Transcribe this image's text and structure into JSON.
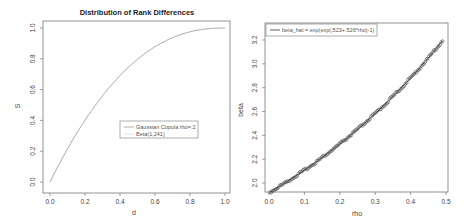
{
  "chart_data": [
    {
      "type": "line",
      "title": "Distribution of Rank Differences",
      "xlabel": "d",
      "ylabel": "S",
      "xlim": [
        0,
        1
      ],
      "ylim": [
        0,
        1
      ],
      "xticks": [
        "0.0",
        "0.2",
        "0.4",
        "0.6",
        "0.8",
        "1.0"
      ],
      "yticks": [
        "0.0",
        "0.2",
        "0.4",
        "0.6",
        "0.8",
        "1.0"
      ],
      "grid": false,
      "legend": {
        "position": "center-right",
        "entries": [
          "Gaussian Copula rho=.2",
          "Beta(1,241)"
        ]
      },
      "series": [
        {
          "name": "Gaussian Copula rho=.2",
          "x": [
            0.0,
            0.1,
            0.2,
            0.3,
            0.4,
            0.5,
            0.6,
            0.7,
            0.8,
            0.9,
            1.0
          ],
          "y": [
            0.0,
            0.21,
            0.4,
            0.56,
            0.7,
            0.8,
            0.88,
            0.94,
            0.975,
            0.993,
            1.0
          ]
        },
        {
          "name": "Beta(1,241)",
          "x": [
            0.0,
            0.1,
            0.2,
            0.3,
            0.4,
            0.5,
            0.6,
            0.7,
            0.8,
            0.9,
            1.0
          ],
          "y": [
            0.0,
            0.21,
            0.4,
            0.56,
            0.7,
            0.8,
            0.88,
            0.94,
            0.975,
            0.993,
            1.0
          ]
        }
      ]
    },
    {
      "type": "scatter",
      "title": "",
      "xlabel": "rho",
      "ylabel": "beta",
      "xlim": [
        0,
        0.5
      ],
      "ylim": [
        2.0,
        3.25
      ],
      "xticks": [
        "0.0",
        "0.1",
        "0.2",
        "0.3",
        "0.4",
        "0.5"
      ],
      "yticks": [
        "2.0",
        "2.2",
        "2.4",
        "2.6",
        "2.8",
        "3.0",
        "3.2"
      ],
      "grid": false,
      "legend": {
        "position": "top-left",
        "entries": [
          "beta_hat = exp(exp(.523+.526*rho)-1)"
        ]
      },
      "series": [
        {
          "name": "beta (points)",
          "x": [
            0.0,
            0.05,
            0.1,
            0.15,
            0.2,
            0.25,
            0.3,
            0.35,
            0.4,
            0.45,
            0.49
          ],
          "y": [
            1.99,
            2.08,
            2.18,
            2.28,
            2.39,
            2.51,
            2.64,
            2.78,
            2.93,
            3.1,
            3.26
          ]
        },
        {
          "name": "beta_hat = exp(exp(.523+.526*rho)-1)",
          "x": [
            0.0,
            0.05,
            0.1,
            0.15,
            0.2,
            0.25,
            0.3,
            0.35,
            0.4,
            0.45,
            0.49
          ],
          "y": [
            1.99,
            2.08,
            2.18,
            2.28,
            2.39,
            2.51,
            2.64,
            2.78,
            2.93,
            3.1,
            3.26
          ]
        }
      ]
    }
  ],
  "left": {
    "title": "Distribution of Rank Differences",
    "xlabel": "d",
    "ylabel": "S",
    "legend": [
      "Gaussian Copula rho=.2",
      "Beta(1,241)"
    ]
  },
  "right": {
    "xlabel": "rho",
    "ylabel": "beta",
    "legend": [
      "beta_hat = exp(exp(.523+.526*rho)-1)"
    ]
  }
}
